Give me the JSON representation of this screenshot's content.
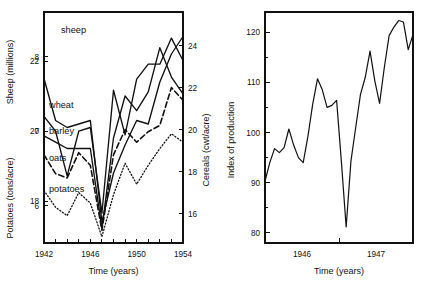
{
  "figure": {
    "background": "#ffffff",
    "ink": "#111111"
  },
  "chart_data": [
    {
      "id": "left",
      "type": "line",
      "title": "",
      "xlabel": "Time (years)",
      "ylabel": "Sheep (millions)",
      "ylabel2": "Potatoes (tons/acre)",
      "ylabel_right": "Cereals (cwt/acre)",
      "grid": false,
      "legend": "inline-labels",
      "xlim": [
        1942,
        1954
      ],
      "xticks": [
        1942,
        1943,
        1944,
        1945,
        1946,
        1947,
        1948,
        1949,
        1950,
        1951,
        1952,
        1953,
        1954
      ],
      "xticklabels": [
        "1942",
        "",
        "",
        "",
        "1946",
        "",
        "",
        "",
        "1950",
        "",
        "",
        "",
        "1954"
      ],
      "axes": {
        "sheep": {
          "label": "Sheep (millions)",
          "ticks": [
            18,
            20,
            22
          ],
          "ticklabels": [
            "18",
            "20",
            "22"
          ],
          "lim": [
            16.8,
            23.4
          ]
        },
        "potatoes": {
          "label": "Potatoes (tons/acre)",
          "ticks": [
            6,
            7,
            8
          ],
          "ticklabels": [
            "6",
            "7",
            "8"
          ],
          "lim": [
            5.5,
            8.6
          ]
        },
        "cereals": {
          "label": "Cereals (cwt/acre)",
          "ticks": [
            16,
            18,
            20,
            22,
            24
          ],
          "ticklabels": [
            "16",
            "18",
            "20",
            "22",
            "24"
          ],
          "lim": [
            14.6,
            25.6
          ]
        }
      },
      "series": [
        {
          "name": "sheep",
          "label": "sheep",
          "style": "solid",
          "axis": "sheep",
          "x": [
            1942,
            1943,
            1944,
            1945,
            1946,
            1947,
            1948,
            1949,
            1950,
            1951,
            1952,
            1953,
            1954
          ],
          "values": [
            21.5,
            20.3,
            20.1,
            20.2,
            20.3,
            17.4,
            18.8,
            19.6,
            20.3,
            20.2,
            21.4,
            22.2,
            22.7
          ]
        },
        {
          "name": "wheat",
          "label": "wheat",
          "style": "solid",
          "axis": "cereals",
          "x": [
            1942,
            1943,
            1944,
            1945,
            1946,
            1947,
            1948,
            1949,
            1950,
            1951,
            1952,
            1953,
            1954
          ],
          "values": [
            19.7,
            19.4,
            19.1,
            19.1,
            19.1,
            15.3,
            19.6,
            21.6,
            20.9,
            21.8,
            23.9,
            22.5,
            21.7
          ]
        },
        {
          "name": "barley",
          "label": "barley",
          "style": "dashed",
          "axis": "cereals",
          "x": [
            1942,
            1943,
            1944,
            1945,
            1946,
            1947,
            1948,
            1949,
            1950,
            1951,
            1952,
            1953,
            1954
          ],
          "values": [
            18.8,
            17.9,
            17.7,
            18.9,
            18.3,
            15.2,
            18.8,
            20.0,
            19.4,
            19.9,
            20.2,
            22.0,
            21.4
          ]
        },
        {
          "name": "oats",
          "label": "oats",
          "style": "dotted",
          "axis": "cereals",
          "x": [
            1942,
            1943,
            1944,
            1945,
            1946,
            1947,
            1948,
            1949,
            1950,
            1951,
            1952,
            1953,
            1954
          ],
          "values": [
            17.1,
            16.3,
            15.9,
            17.0,
            16.5,
            14.9,
            16.9,
            18.4,
            17.4,
            18.3,
            19.1,
            19.8,
            19.4
          ]
        },
        {
          "name": "potatoes",
          "label": "potatoes",
          "style": "solid",
          "axis": "potatoes",
          "x": [
            1942,
            1943,
            1944,
            1945,
            1946,
            1947,
            1948,
            1949,
            1950,
            1951,
            1952,
            1953,
            1954
          ],
          "values": [
            7.2,
            7.0,
            6.4,
            7.0,
            7.05,
            5.9,
            7.55,
            6.95,
            7.7,
            7.9,
            7.9,
            8.25,
            7.95
          ]
        }
      ]
    },
    {
      "id": "right",
      "type": "line",
      "title": "",
      "xlabel": "Time (years)",
      "ylabel": "Index of production",
      "grid": false,
      "legend": "none",
      "ylim": [
        78,
        124
      ],
      "yticks": [
        80,
        90,
        100,
        110,
        120
      ],
      "yticklabels": [
        "80",
        "90",
        "100",
        "110",
        "120"
      ],
      "xticklabels": [
        "1946",
        "1947"
      ],
      "series": [
        {
          "name": "index-of-production",
          "label": "Index of production",
          "style": "solid",
          "x": [
            0,
            1,
            2,
            3,
            4,
            5,
            6,
            7,
            8,
            9,
            10,
            11,
            12,
            13,
            14,
            15,
            16,
            17,
            18,
            19,
            20,
            21,
            22,
            23,
            24,
            25,
            26,
            27,
            28,
            29,
            30,
            31
          ],
          "values": [
            90.3,
            94.0,
            96.8,
            96.0,
            97.0,
            100.7,
            97.5,
            95.0,
            94.0,
            99.3,
            105.7,
            110.7,
            108.5,
            105.0,
            105.4,
            106.4,
            94.2,
            81.2,
            94.3,
            101.0,
            107.6,
            111.0,
            116.2,
            110.3,
            105.8,
            113.0,
            119.3,
            121.0,
            122.3,
            122.0,
            116.5,
            119.5
          ]
        }
      ]
    }
  ]
}
